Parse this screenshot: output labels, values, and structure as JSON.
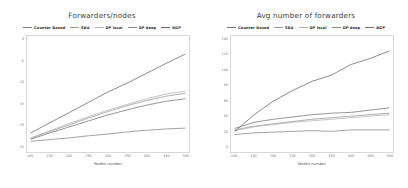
{
  "panels": [
    {
      "title": "Forwarders/nodes",
      "xlabel": "Nodes number"
    },
    {
      "title": "Avg number of forwarders",
      "xlabel": "Nodes number"
    }
  ],
  "legend": {
    "items": [
      {
        "label": "Counter Based",
        "color": "#7b7b7b"
      },
      {
        "label": "SBA",
        "color": "#9a9a9a"
      },
      {
        "label": "DP local",
        "color": "#b5b5b5"
      },
      {
        "label": "DP deep",
        "color": "#8a8a8a"
      },
      {
        "label": "BGP",
        "color": "#6e6e6e"
      }
    ]
  },
  "chart_data": [
    {
      "type": "line",
      "title": "Forwarders/nodes",
      "xlabel": "Nodes number",
      "ylabel": "",
      "x": [
        100,
        150,
        200,
        250,
        300,
        350,
        400,
        450,
        500
      ],
      "xticklabels": [
        "100",
        "150",
        "200",
        "250",
        "300",
        "350",
        "400",
        "450",
        "500"
      ],
      "yticklabels": [
        "0",
        "5",
        "10",
        "15",
        "20",
        "25"
      ],
      "xlim": [
        100,
        500
      ],
      "ylim": [
        0,
        25
      ],
      "grid": false,
      "legend_position": "top",
      "series": [
        {
          "name": "Counter Based",
          "color": "#7b7b7b",
          "values": [
            2.1,
            3.6,
            5.0,
            6.4,
            7.8,
            9.0,
            10.1,
            11.0,
            11.6
          ]
        },
        {
          "name": "SBA",
          "color": "#9a9a9a",
          "values": [
            2.3,
            3.9,
            5.5,
            7.1,
            8.6,
            10.0,
            11.2,
            12.2,
            12.9
          ]
        },
        {
          "name": "DP local",
          "color": "#b5b5b5",
          "values": [
            2.4,
            4.1,
            5.8,
            7.4,
            8.9,
            10.3,
            11.6,
            12.7,
            13.4
          ]
        },
        {
          "name": "DP deep",
          "color": "#8a8a8a",
          "values": [
            1.6,
            2.0,
            2.4,
            2.9,
            3.3,
            3.8,
            4.2,
            4.5,
            4.7
          ]
        },
        {
          "name": "BGP",
          "color": "#6e6e6e",
          "values": [
            3.6,
            6.0,
            8.4,
            10.8,
            13.2,
            15.3,
            17.6,
            19.9,
            22.1
          ]
        }
      ]
    },
    {
      "type": "line",
      "title": "Avg number of forwarders",
      "xlabel": "Nodes number",
      "ylabel": "",
      "x": [
        100,
        150,
        200,
        250,
        300,
        350,
        400,
        450,
        500
      ],
      "xticklabels": [
        "100",
        "150",
        "200",
        "250",
        "300",
        "350",
        "400",
        "450",
        "500"
      ],
      "yticklabels": [
        "140",
        "120",
        "100",
        "80",
        "60",
        "40",
        "20",
        "0"
      ],
      "xlim": [
        100,
        500
      ],
      "ylim": [
        0,
        140
      ],
      "grid": false,
      "legend_position": "top",
      "series": [
        {
          "name": "Counter Based",
          "color": "#7b7b7b",
          "values": [
            26,
            34,
            38,
            41,
            44,
            46,
            47,
            50,
            53
          ]
        },
        {
          "name": "SBA",
          "color": "#9a9a9a",
          "values": [
            24,
            29,
            32,
            35,
            38,
            40,
            42,
            44,
            46
          ]
        },
        {
          "name": "DP local",
          "color": "#b5b5b5",
          "values": [
            23,
            28,
            31,
            34,
            36,
            38,
            40,
            42,
            44
          ]
        },
        {
          "name": "DP deep",
          "color": "#8a8a8a",
          "values": [
            18,
            20,
            21,
            22,
            23,
            22,
            24,
            24,
            24
          ]
        },
        {
          "name": "BGP",
          "color": "#6e6e6e",
          "values": [
            22,
            44,
            62,
            76,
            88,
            96,
            110,
            118,
            128
          ]
        }
      ]
    }
  ]
}
